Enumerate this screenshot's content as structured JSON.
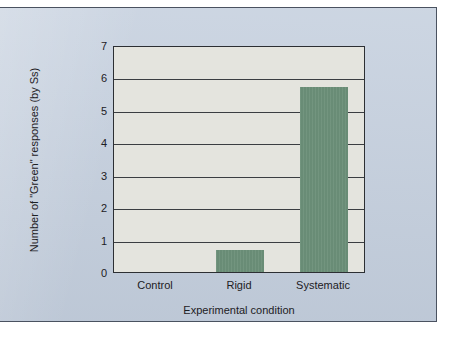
{
  "chart_data": {
    "type": "bar",
    "title": "",
    "subtitle": "",
    "categories": [
      "Control",
      "Rigid",
      "Systematic"
    ],
    "values": [
      0,
      0.68,
      5.7
    ],
    "series": [
      {
        "name": "Number of \"Green\" responses (by Ss)",
        "values": [
          0,
          0.68,
          5.7
        ]
      }
    ],
    "xlabel": "Experimental condition",
    "ylabel": "Number of \"Green\" responses (by Ss)",
    "ylim": [
      0,
      7
    ],
    "yticks": [
      0,
      1,
      2,
      3,
      4,
      5,
      6,
      7
    ],
    "ytick_labels": [
      "0",
      "1",
      "2",
      "3",
      "4",
      "5",
      "6",
      "7"
    ],
    "grid": true,
    "grid_axis": "y",
    "legend": false,
    "legend_position": "none",
    "bar_color": "#6b8f78",
    "plot_background": "#e4e4de",
    "figure_background": "#c3cedd",
    "grid_color": "#3a3d41",
    "text_color": "#1d2024"
  }
}
